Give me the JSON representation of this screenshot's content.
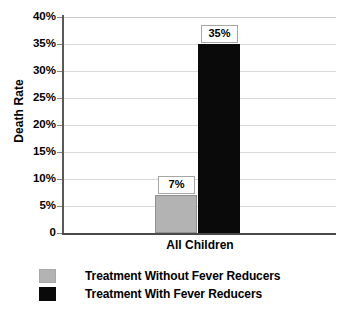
{
  "chart_data": {
    "type": "bar",
    "title": "",
    "xlabel": "",
    "ylabel": "Death Rate",
    "categories": [
      "All Children"
    ],
    "ylim": [
      0,
      40
    ],
    "ytick_labels": [
      "40%",
      "35%",
      "30%",
      "25%",
      "20%",
      "15%",
      "10%",
      "5%",
      "0"
    ],
    "ytick_values": [
      40,
      35,
      30,
      25,
      20,
      15,
      10,
      5,
      0
    ],
    "grid": true,
    "legend_position": "bottom-left",
    "series": [
      {
        "name": "Treatment Without Fever Reducers",
        "values": [
          7
        ],
        "data_labels": [
          "7%"
        ],
        "color": "#b3b3b3"
      },
      {
        "name": "Treatment With Fever Reducers",
        "values": [
          35
        ],
        "data_labels": [
          "35%"
        ],
        "color": "#0a0a0a"
      }
    ]
  },
  "axis": {
    "y_title": "Death Rate"
  },
  "legend": {
    "items": [
      {
        "label": "Treatment Without Fever Reducers",
        "color": "#b3b3b3"
      },
      {
        "label": "Treatment With Fever Reducers",
        "color": "#0a0a0a"
      }
    ]
  },
  "colors": {
    "gridline": "#d9d9d9",
    "axis": "#4a4a4a",
    "series_gray": "#b3b3b3",
    "series_black": "#0a0a0a",
    "label_box_border": "#a6a6a6",
    "background": "#ffffff"
  }
}
